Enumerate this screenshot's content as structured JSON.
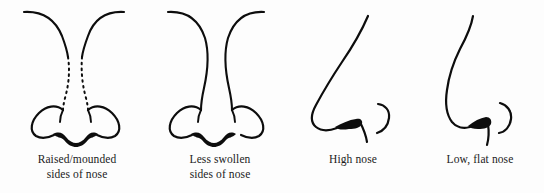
{
  "figure": {
    "background_color": "#fdfdfd",
    "ink_color": "#0d0d0d",
    "panel_count": 4
  },
  "panels": [
    {
      "id": "raised-mounded-sides",
      "view": "frontal",
      "illustration_name": "nose-frontal-raised-mounded",
      "caption_line_1": "Raised/mounded",
      "caption_line_2": "sides of nose",
      "has_dotted_sides": true
    },
    {
      "id": "less-swollen-sides",
      "view": "frontal",
      "illustration_name": "nose-frontal-less-swollen",
      "caption_line_1": "Less swollen",
      "caption_line_2": "sides of nose",
      "has_dotted_sides": false
    },
    {
      "id": "high-nose",
      "view": "profile",
      "illustration_name": "nose-profile-high",
      "caption_line_1": "High nose",
      "caption_line_2": "",
      "has_dotted_sides": false
    },
    {
      "id": "low-flat-nose",
      "view": "profile",
      "illustration_name": "nose-profile-low-flat",
      "caption_line_1": "Low, flat nose",
      "caption_line_2": "",
      "has_dotted_sides": false
    }
  ]
}
